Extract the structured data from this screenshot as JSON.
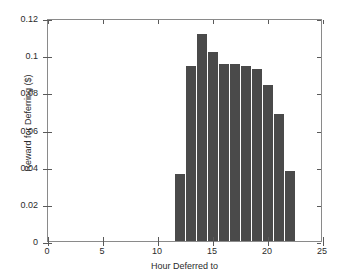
{
  "chart_data": {
    "type": "bar",
    "title": "",
    "xlabel": "Hour Deferred to",
    "ylabel": "Reward for Deferring ($)",
    "xlim": [
      0,
      25
    ],
    "ylim": [
      0,
      0.12
    ],
    "grid": false,
    "legend": null,
    "bar_color": "#4a4a4a",
    "axis_color": "#8a8a8a",
    "xticks": [
      0,
      5,
      10,
      15,
      20,
      25
    ],
    "xtick_labels": [
      "0",
      "5",
      "10",
      "15",
      "20",
      "25"
    ],
    "yticks": [
      0,
      0.02,
      0.04,
      0.06,
      0.08,
      0.1,
      0.12
    ],
    "ytick_labels": [
      "0",
      "0.02",
      "0.04",
      "0.06",
      "0.08",
      "0.1",
      "0.12"
    ],
    "categories": [
      12,
      13,
      14,
      15,
      16,
      17,
      18,
      19,
      20,
      21,
      22
    ],
    "values": [
      0.036,
      0.094,
      0.1115,
      0.1015,
      0.0955,
      0.0955,
      0.094,
      0.0925,
      0.084,
      0.0685,
      0.0375
    ],
    "bar_width": 0.85
  }
}
